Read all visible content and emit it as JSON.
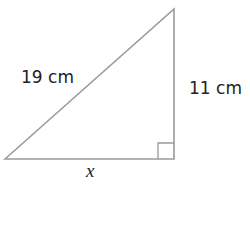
{
  "diagram": {
    "type": "right-triangle",
    "hypotenuse_label": "19 cm",
    "vertical_leg_label": "11 cm",
    "horizontal_leg_label": "x",
    "line_color": "#9a9a9a"
  }
}
